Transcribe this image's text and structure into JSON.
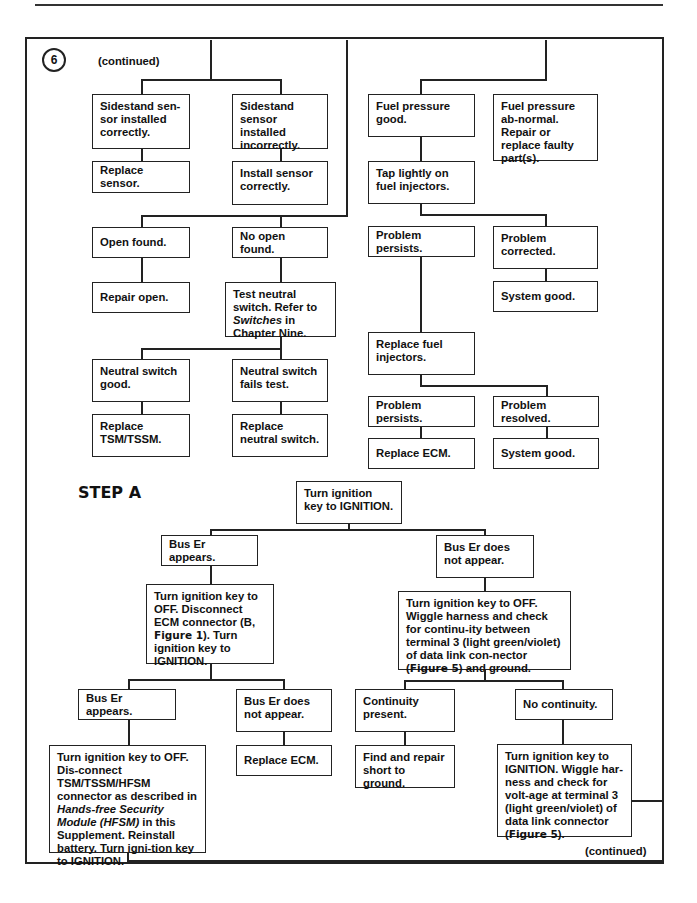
{
  "figure": {
    "number": "6",
    "continued_top": "(continued)",
    "continued_bottom": "(continued)",
    "step_label": "STEP A"
  },
  "nodes": {
    "sidestand_ok": "Sidestand sen-sor installed correctly.",
    "sidestand_bad": "Sidestand sensor installed incorrectly.",
    "replace_sensor": "Replace sensor.",
    "install_sensor": "Install sensor correctly.",
    "open_found": "Open found.",
    "no_open_found": "No open found.",
    "repair_open": "Repair open.",
    "test_neutral_1": "Test neutral switch. Refer to ",
    "test_neutral_italic": "Switches",
    "test_neutral_2": " in Chapter Nine.",
    "neutral_good": "Neutral switch good.",
    "neutral_fails": "Neutral switch fails test.",
    "replace_tsm": "Replace TSM/TSSM.",
    "replace_neutral": "Replace neutral switch.",
    "fuel_good": "Fuel pressure good.",
    "fuel_abnormal": "Fuel pressure ab-normal. Repair or replace faulty part(s).",
    "tap_injectors": "Tap lightly on fuel injectors.",
    "problem_persists_1": "Problem persists.",
    "problem_corrected": "Problem corrected.",
    "system_good_1": "System good.",
    "replace_injectors": "Replace fuel injectors.",
    "problem_persists_2": "Problem persists.",
    "problem_resolved": "Problem resolved.",
    "replace_ecm_1": "Replace ECM.",
    "system_good_2": "System good.",
    "turn_ignition": "Turn ignition key to IGNITION.",
    "bus_er_appears_1": "Bus Er appears.",
    "bus_er_not_1": "Bus Er does not appear.",
    "disconnect_ecm_1": "Turn ignition key to OFF. Disconnect ECM connector (B, ",
    "disconnect_ecm_fig": "Figure 1",
    "disconnect_ecm_2": "). Turn ignition key to IGNITION.",
    "wiggle_1": "Turn ignition key to OFF. Wiggle harness and check for continu-ity between  terminal 3 (light green/violet) of data link con-nector (",
    "wiggle_fig": "Figure 5",
    "wiggle_2": ") and ground.",
    "bus_er_appears_2": "Bus Er appears.",
    "bus_er_not_2": "Bus Er does not appear.",
    "continuity_present": "Continuity present.",
    "no_continuity": "No continuity.",
    "disconnect_tsm_1": "Turn ignition key to OFF. Dis-connect TSM/TSSM/HFSM connector as described in ",
    "disconnect_tsm_italic": "Hands-free Security Module (HFSM)",
    "disconnect_tsm_2": " in this Supplement. Reinstall battery. Turn igni-tion key to IGNITION.",
    "replace_ecm_2": "Replace ECM.",
    "find_short": "Find and repair short to ground.",
    "voltage_1": "Turn ignition key to IGNITION. Wiggle har-ness and check for volt-age at terminal 3 (light green/violet) of data link connector (",
    "voltage_fig": "Figure 5",
    "voltage_2": ")."
  }
}
